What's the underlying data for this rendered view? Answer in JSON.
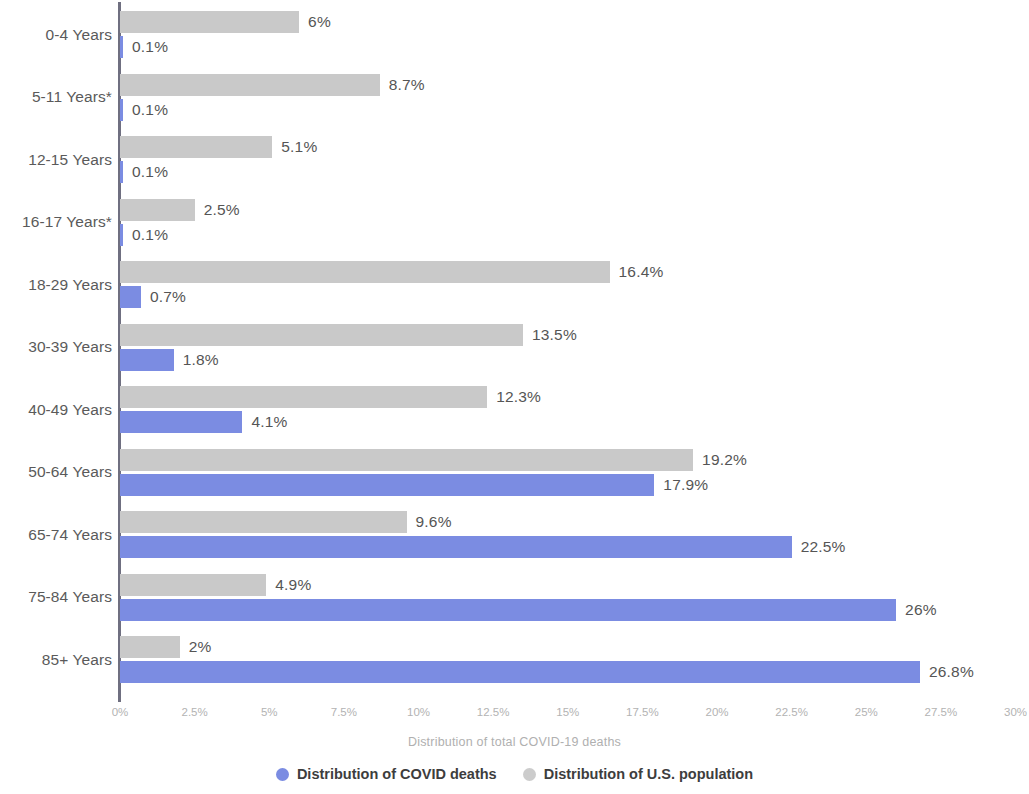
{
  "chart_data": {
    "type": "bar",
    "orientation": "horizontal",
    "title": "",
    "xlabel": "Distribution of total COVID-19 deaths",
    "ylabel": "",
    "xlim": [
      0,
      30
    ],
    "xticks": [
      "0%",
      "2.5%",
      "5%",
      "7.5%",
      "10%",
      "12.5%",
      "15%",
      "17.5%",
      "20%",
      "22.5%",
      "25%",
      "27.5%",
      "30%"
    ],
    "xtick_values": [
      0,
      2.5,
      5,
      7.5,
      10,
      12.5,
      15,
      17.5,
      20,
      22.5,
      25,
      27.5,
      30
    ],
    "grid": false,
    "legend_position": "bottom",
    "categories": [
      "0-4 Years",
      "5-11 Years*",
      "12-15 Years",
      "16-17 Years*",
      "18-29 Years",
      "30-39 Years",
      "40-49 Years",
      "50-64 Years",
      "65-74 Years",
      "75-84 Years",
      "85+ Years"
    ],
    "series": [
      {
        "name": "Distribution of U.S. population",
        "key": "pop",
        "color": "#c9c9c9",
        "values": [
          6,
          8.7,
          5.1,
          2.5,
          16.4,
          13.5,
          12.3,
          19.2,
          9.6,
          4.9,
          2
        ],
        "labels": [
          "6%",
          "8.7%",
          "5.1%",
          "2.5%",
          "16.4%",
          "13.5%",
          "12.3%",
          "19.2%",
          "9.6%",
          "4.9%",
          "2%"
        ]
      },
      {
        "name": "Distribution of COVID deaths",
        "key": "deaths",
        "color": "#7b8ce2",
        "values": [
          0.1,
          0.1,
          0.1,
          0.1,
          0.7,
          1.8,
          4.1,
          17.9,
          22.5,
          26,
          26.8
        ],
        "labels": [
          "0.1%",
          "0.1%",
          "0.1%",
          "0.1%",
          "0.7%",
          "1.8%",
          "4.1%",
          "17.9%",
          "22.5%",
          "26%",
          "26.8%"
        ]
      }
    ]
  },
  "legend": {
    "items": [
      {
        "label": "Distribution of COVID deaths",
        "key": "deaths"
      },
      {
        "label": "Distribution of U.S. population",
        "key": "pop"
      }
    ]
  }
}
